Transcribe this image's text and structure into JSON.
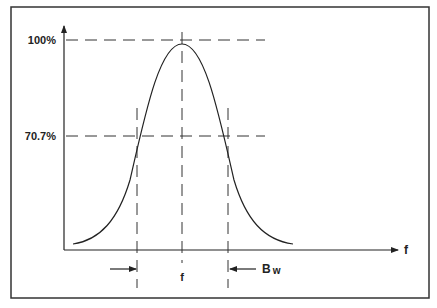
{
  "diagram": {
    "type": "bandwidth-curve",
    "y_labels": {
      "peak": "100%",
      "half_power": "70.7%"
    },
    "x_axis_label": "f",
    "center_label": "f",
    "bandwidth_label_main": "B",
    "bandwidth_label_sub": "w",
    "colors": {
      "line": "#222222",
      "frame": "#333333",
      "background": "#ffffff"
    }
  }
}
